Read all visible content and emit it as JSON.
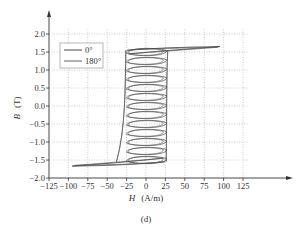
{
  "chart_data": {
    "type": "line",
    "title": "",
    "caption": "(d)",
    "xlabel": "H",
    "xunit": "(A/m)",
    "ylabel": "B",
    "yunit": "(T)",
    "xlim": [
      -125,
      125
    ],
    "ylim": [
      -2.0,
      2.0
    ],
    "xticks": [
      -125,
      -100,
      -75,
      -50,
      -25,
      0,
      25,
      50,
      75,
      100,
      125
    ],
    "xtick_labels": [
      "−125",
      "−100",
      "−75",
      "−50",
      "−25",
      "0",
      "25",
      "50",
      "75",
      "100",
      "125"
    ],
    "yticks": [
      2.0,
      1.5,
      1.0,
      0.5,
      0.0,
      -0.5,
      -1.0,
      -1.5,
      -2.0
    ],
    "ytick_labels": [
      "2.0",
      "1.5",
      "1.0",
      "0.5",
      "0.0",
      "−0.5",
      "−1.0",
      "−1.5",
      "−2.0"
    ],
    "grid": true,
    "grid_style": "dotted",
    "legend_position": "upper-left",
    "legend": [
      "0°",
      "180°"
    ],
    "series": [
      {
        "name": "0°",
        "description": "family of minor hysteresis loops stacked along B, centered near H≈0, width ≈ −25..+25 A/m, saturating tip at H≈+95, B≈+1.65 and H≈−95, B≈−1.67",
        "loop_centers_B": [
          1.5,
          1.25,
          1.0,
          0.75,
          0.5,
          0.25,
          0.0,
          -0.25,
          -0.5,
          -0.75,
          -1.0,
          -1.25,
          -1.5
        ],
        "loop_half_width_H": 25,
        "loop_half_height_B": 0.12,
        "upper_tip": {
          "H": 95,
          "B": 1.65
        },
        "lower_tip": {
          "H": -95,
          "B": -1.67
        }
      },
      {
        "name": "180°",
        "description": "mirror family of minor loops, nearly overlapping 0° series",
        "loop_centers_B": [
          1.5,
          1.25,
          1.0,
          0.75,
          0.5,
          0.25,
          0.0,
          -0.25,
          -0.5,
          -0.75,
          -1.0,
          -1.25,
          -1.5
        ],
        "loop_half_width_H": 24,
        "loop_half_height_B": 0.11,
        "upper_tip": {
          "H": 92,
          "B": 1.63
        },
        "lower_tip": {
          "H": -92,
          "B": -1.65
        }
      }
    ]
  }
}
